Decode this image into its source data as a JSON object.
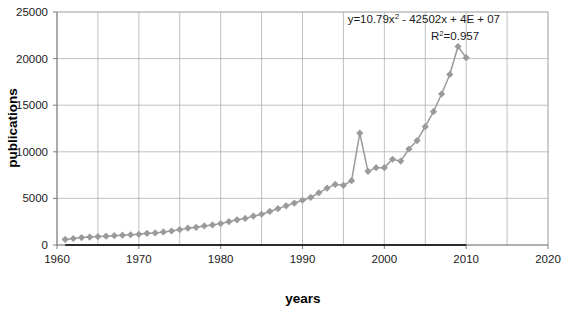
{
  "chart_data": {
    "type": "line",
    "title": "",
    "xlabel": "years",
    "ylabel": "publications",
    "xlim": [
      1960,
      2020
    ],
    "ylim": [
      0,
      25000
    ],
    "xticks": [
      1960,
      1970,
      1980,
      1990,
      2000,
      2010,
      2020
    ],
    "xtick_labels": [
      "1960",
      "1970",
      "1980",
      "1990",
      "2000",
      "2010",
      "2020"
    ],
    "yticks": [
      0,
      5000,
      10000,
      15000,
      20000,
      25000
    ],
    "ytick_labels": [
      "0",
      "5000",
      "10000",
      "15000",
      "20000",
      "25000"
    ],
    "grid": "both",
    "grid_x_step": 5,
    "legend": "none",
    "marker": "diamond",
    "marker_color": "#9a9a9a",
    "line_color": "#9a9a9a",
    "trendline_color": "#000000",
    "grid_color": "#b0b0b0",
    "axis_color": "#7f7f7f",
    "series": [
      {
        "name": "publications",
        "x": [
          1961,
          1962,
          1963,
          1964,
          1965,
          1966,
          1967,
          1968,
          1969,
          1970,
          1971,
          1972,
          1973,
          1974,
          1975,
          1976,
          1977,
          1978,
          1979,
          1980,
          1981,
          1982,
          1983,
          1984,
          1985,
          1986,
          1987,
          1988,
          1989,
          1990,
          1991,
          1992,
          1993,
          1994,
          1995,
          1996,
          1997,
          1998,
          1999,
          2000,
          2001,
          2002,
          2003,
          2004,
          2005,
          2006,
          2007,
          2008,
          2009,
          2010
        ],
        "values": [
          600,
          700,
          800,
          850,
          900,
          950,
          1000,
          1050,
          1100,
          1150,
          1250,
          1300,
          1400,
          1500,
          1650,
          1800,
          1900,
          2050,
          2150,
          2300,
          2500,
          2700,
          2850,
          3100,
          3300,
          3600,
          3900,
          4200,
          4500,
          4800,
          5100,
          5600,
          6100,
          6500,
          6400,
          6900,
          12000,
          7900,
          8300,
          8300,
          9200,
          9000,
          10300,
          11200,
          12700,
          14300,
          16200,
          18300,
          21300,
          20100
        ]
      }
    ],
    "trendline": {
      "equation": "y=10.79x",
      "equation_sup1": "2",
      "equation_rest": " - 42502x + 4E + 07",
      "r2_label": "R",
      "r2_sup": "2",
      "r2_value": "=0.957",
      "a": 10.79,
      "b": -42502,
      "c": 40000000
    }
  }
}
